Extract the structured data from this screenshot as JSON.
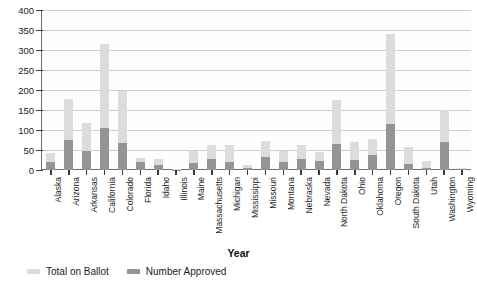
{
  "chart_data": {
    "type": "bar",
    "subtype": "stacked-bar",
    "title": "",
    "xlabel": "Year",
    "ylabel": "",
    "ylim": [
      0,
      400
    ],
    "yticks": [
      0,
      50,
      100,
      150,
      200,
      250,
      300,
      350,
      400
    ],
    "grid": true,
    "legend_position": "bottom-left",
    "categories": [
      "Alaska",
      "Arizona",
      "Arkansas",
      "California",
      "Colorado",
      "Florida",
      "Idaho",
      "Illinois",
      "Maine",
      "Massachusetts",
      "Michigan",
      "Mississippi",
      "Missouri",
      "Montana",
      "Nebraska",
      "Nevada",
      "North Dakota",
      "Ohio",
      "Oklahoma",
      "Oregon",
      "South Dakota",
      "Utah",
      "Washington",
      "Wyoming"
    ],
    "series": [
      {
        "name": "Total on Ballot",
        "color": "#dcdcdc",
        "values": [
          42,
          177,
          118,
          315,
          198,
          30,
          28,
          3,
          48,
          62,
          62,
          12,
          73,
          47,
          62,
          45,
          175,
          70,
          78,
          340,
          57,
          22,
          150,
          6
        ]
      },
      {
        "name": "Number Approved",
        "color": "#949494",
        "values": [
          20,
          76,
          47,
          105,
          68,
          20,
          12,
          1,
          18,
          28,
          19,
          5,
          32,
          20,
          28,
          22,
          64,
          25,
          38,
          115,
          16,
          4,
          70,
          2
        ]
      }
    ]
  },
  "axis": {
    "x_title": "Year"
  },
  "legend": {
    "items": [
      {
        "label": "Total on Ballot",
        "color": "#dcdcdc"
      },
      {
        "label": "Number Approved",
        "color": "#949494"
      }
    ]
  }
}
